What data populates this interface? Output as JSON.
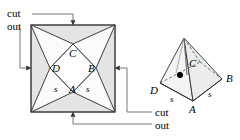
{
  "figure": {
    "colors": {
      "stroke": "#3a3a3a",
      "flap_fill": "#e2e2e2",
      "face_fill": "#f7f7f7",
      "background": "#ffffff",
      "text": "#000000"
    },
    "annotations": {
      "top_cut": "cut",
      "top_out": "out",
      "bottom_cut": "cut",
      "bottom_out": "out"
    },
    "net": {
      "labels": {
        "A": "A",
        "B": "B",
        "C": "C",
        "D": "D",
        "s_left": "s",
        "s_right": "s"
      }
    },
    "pyramid": {
      "labels": {
        "A": "A",
        "B": "B",
        "C": "C",
        "D": "D",
        "s_left": "s",
        "s_right": "s"
      },
      "center_dot": "center-point"
    }
  }
}
